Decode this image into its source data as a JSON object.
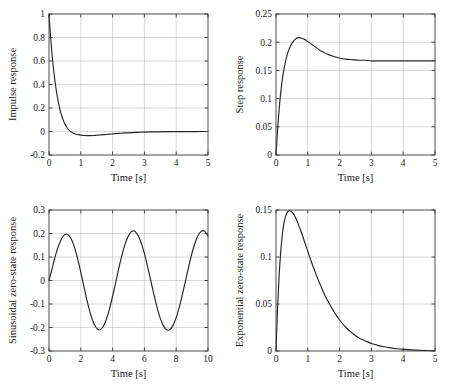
{
  "figure": {
    "background_color": "#ffffff",
    "curve_color": "#262626",
    "grid_color": "#b9b9b9",
    "axis_color": "#3a3a3a",
    "rows": 2,
    "cols": 2
  },
  "chart_data": [
    {
      "id": "impulse",
      "type": "line",
      "title": "",
      "xlabel": "Time [s]",
      "ylabel": "Impulse response",
      "xlim": [
        0,
        5
      ],
      "ylim": [
        -0.2,
        1
      ],
      "xticks": [
        0,
        1,
        2,
        3,
        4,
        5
      ],
      "xtick_labels": [
        "0",
        "1",
        "2",
        "3",
        "4",
        "5"
      ],
      "yticks": [
        -0.2,
        0,
        0.2,
        0.4,
        0.6,
        0.8,
        1
      ],
      "ytick_labels": [
        "-0.2",
        "0",
        "0.2",
        "0.4",
        "0.6",
        "0.8",
        "1"
      ],
      "grid": true,
      "legend": null,
      "series": [
        {
          "name": "impulse response",
          "x": [
            0,
            0.05,
            0.1,
            0.15,
            0.2,
            0.25,
            0.3,
            0.35,
            0.4,
            0.45,
            0.5,
            0.55,
            0.6,
            0.65,
            0.7,
            0.75,
            0.8,
            0.85,
            0.9,
            0.95,
            1.0,
            1.1,
            1.2,
            1.3,
            1.4,
            1.5,
            1.6,
            1.7,
            1.8,
            1.9,
            2.0,
            2.2,
            2.4,
            2.6,
            2.8,
            3.0,
            3.4,
            3.8,
            4.2,
            4.6,
            5.0
          ],
          "y": [
            1.0,
            0.805,
            0.645,
            0.513,
            0.404,
            0.315,
            0.242,
            0.182,
            0.134,
            0.095,
            0.064,
            0.04,
            0.021,
            0.007,
            -0.004,
            -0.012,
            -0.018,
            -0.023,
            -0.026,
            -0.029,
            -0.031,
            -0.034,
            -0.035,
            -0.035,
            -0.034,
            -0.032,
            -0.03,
            -0.027,
            -0.025,
            -0.022,
            -0.02,
            -0.016,
            -0.012,
            -0.009,
            -0.007,
            -0.005,
            -0.003,
            -0.0015,
            -0.0008,
            -0.0004,
            -0.0002
          ]
        }
      ]
    },
    {
      "id": "step",
      "type": "line",
      "title": "",
      "xlabel": "Time [s]",
      "ylabel": "Step response",
      "xlim": [
        0,
        5
      ],
      "ylim": [
        0,
        0.25
      ],
      "xticks": [
        0,
        1,
        2,
        3,
        4,
        5
      ],
      "xtick_labels": [
        "0",
        "1",
        "2",
        "3",
        "4",
        "5"
      ],
      "yticks": [
        0,
        0.05,
        0.1,
        0.15,
        0.2,
        0.25
      ],
      "ytick_labels": [
        "0",
        "0.05",
        "0.1",
        "0.15",
        "0.2",
        "0.25"
      ],
      "grid": true,
      "legend": null,
      "series": [
        {
          "name": "step response",
          "x": [
            0,
            0.05,
            0.1,
            0.15,
            0.2,
            0.25,
            0.3,
            0.35,
            0.4,
            0.45,
            0.5,
            0.55,
            0.6,
            0.65,
            0.7,
            0.75,
            0.8,
            0.9,
            1.0,
            1.1,
            1.2,
            1.3,
            1.4,
            1.5,
            1.6,
            1.8,
            2.0,
            2.2,
            2.4,
            2.6,
            2.8,
            3.0,
            3.4,
            3.8,
            4.2,
            4.6,
            5.0
          ],
          "y": [
            0.0,
            0.045,
            0.082,
            0.111,
            0.134,
            0.152,
            0.166,
            0.177,
            0.186,
            0.193,
            0.198,
            0.202,
            0.205,
            0.207,
            0.208,
            0.208,
            0.207,
            0.205,
            0.201,
            0.197,
            0.193,
            0.189,
            0.185,
            0.182,
            0.179,
            0.175,
            0.172,
            0.17,
            0.169,
            0.168,
            0.168,
            0.167,
            0.167,
            0.167,
            0.167,
            0.167,
            0.167
          ]
        }
      ]
    },
    {
      "id": "sinusoidal-zero-state",
      "type": "line",
      "title": "",
      "xlabel": "Time [s]",
      "ylabel": "Sinusoidal zero-state response",
      "xlim": [
        0,
        10
      ],
      "ylim": [
        -0.3,
        0.3
      ],
      "xticks": [
        0,
        2,
        4,
        6,
        8,
        10
      ],
      "xtick_labels": [
        "0",
        "2",
        "4",
        "6",
        "8",
        "10"
      ],
      "yticks": [
        -0.3,
        -0.2,
        -0.1,
        0,
        0.1,
        0.2,
        0.3
      ],
      "ytick_labels": [
        "-0.3",
        "-0.2",
        "-0.1",
        "0",
        "0.1",
        "0.2",
        "0.3"
      ],
      "grid": true,
      "legend": null,
      "amplitude_steady": 0.218,
      "period": 3.15,
      "series": [
        {
          "name": "sinusoidal zero-state response",
          "x": [
            0,
            0.2,
            0.4,
            0.6,
            0.8,
            1.0,
            1.2,
            1.4,
            1.6,
            1.8,
            2.0,
            2.2,
            2.4,
            2.6,
            2.8,
            3.0,
            3.2,
            3.4,
            3.6,
            3.8,
            4.0,
            4.2,
            4.4,
            4.6,
            4.8,
            5.0,
            5.2,
            5.4,
            5.6,
            5.8,
            6.0,
            6.2,
            6.4,
            6.6,
            6.8,
            7.0,
            7.2,
            7.4,
            7.6,
            7.8,
            8.0,
            8.2,
            8.4,
            8.6,
            8.8,
            9.0,
            9.2,
            9.4,
            9.6,
            9.8,
            10.0
          ],
          "y": [
            0.0,
            0.052,
            0.105,
            0.148,
            0.179,
            0.196,
            0.195,
            0.177,
            0.142,
            0.093,
            0.035,
            -0.027,
            -0.088,
            -0.14,
            -0.18,
            -0.204,
            -0.21,
            -0.197,
            -0.167,
            -0.122,
            -0.067,
            -0.007,
            0.055,
            0.111,
            0.158,
            0.191,
            0.209,
            0.209,
            0.192,
            0.16,
            0.114,
            0.059,
            0.0,
            -0.06,
            -0.115,
            -0.161,
            -0.193,
            -0.21,
            -0.209,
            -0.191,
            -0.158,
            -0.112,
            -0.057,
            0.003,
            0.063,
            0.118,
            0.163,
            0.195,
            0.211,
            0.209,
            0.19
          ]
        }
      ]
    },
    {
      "id": "exponential-zero-state",
      "type": "line",
      "title": "",
      "xlabel": "Time [s]",
      "ylabel": "Exponential zero-state response",
      "xlim": [
        0,
        5
      ],
      "ylim": [
        0,
        0.15
      ],
      "xticks": [
        0,
        1,
        2,
        3,
        4,
        5
      ],
      "xtick_labels": [
        "0",
        "1",
        "2",
        "3",
        "4",
        "5"
      ],
      "yticks": [
        0,
        0.05,
        0.1,
        0.15
      ],
      "ytick_labels": [
        "0",
        "0.05",
        "0.1",
        "0.15"
      ],
      "grid": true,
      "legend": null,
      "peak_value": 0.149,
      "peak_time": 0.42,
      "series": [
        {
          "name": "exponential zero-state response",
          "x": [
            0,
            0.05,
            0.1,
            0.15,
            0.2,
            0.25,
            0.3,
            0.35,
            0.4,
            0.45,
            0.5,
            0.6,
            0.7,
            0.8,
            0.9,
            1.0,
            1.1,
            1.2,
            1.3,
            1.4,
            1.5,
            1.6,
            1.8,
            2.0,
            2.2,
            2.4,
            2.6,
            2.8,
            3.0,
            3.2,
            3.4,
            3.6,
            3.8,
            4.0,
            4.4,
            4.8,
            5.0
          ],
          "y": [
            0.0,
            0.046,
            0.081,
            0.106,
            0.124,
            0.136,
            0.143,
            0.147,
            0.149,
            0.149,
            0.148,
            0.143,
            0.135,
            0.126,
            0.116,
            0.106,
            0.096,
            0.087,
            0.078,
            0.07,
            0.062,
            0.055,
            0.043,
            0.033,
            0.025,
            0.019,
            0.014,
            0.011,
            0.008,
            0.006,
            0.0045,
            0.0033,
            0.0024,
            0.0018,
            0.0009,
            0.0005,
            0.0003
          ]
        }
      ]
    }
  ]
}
